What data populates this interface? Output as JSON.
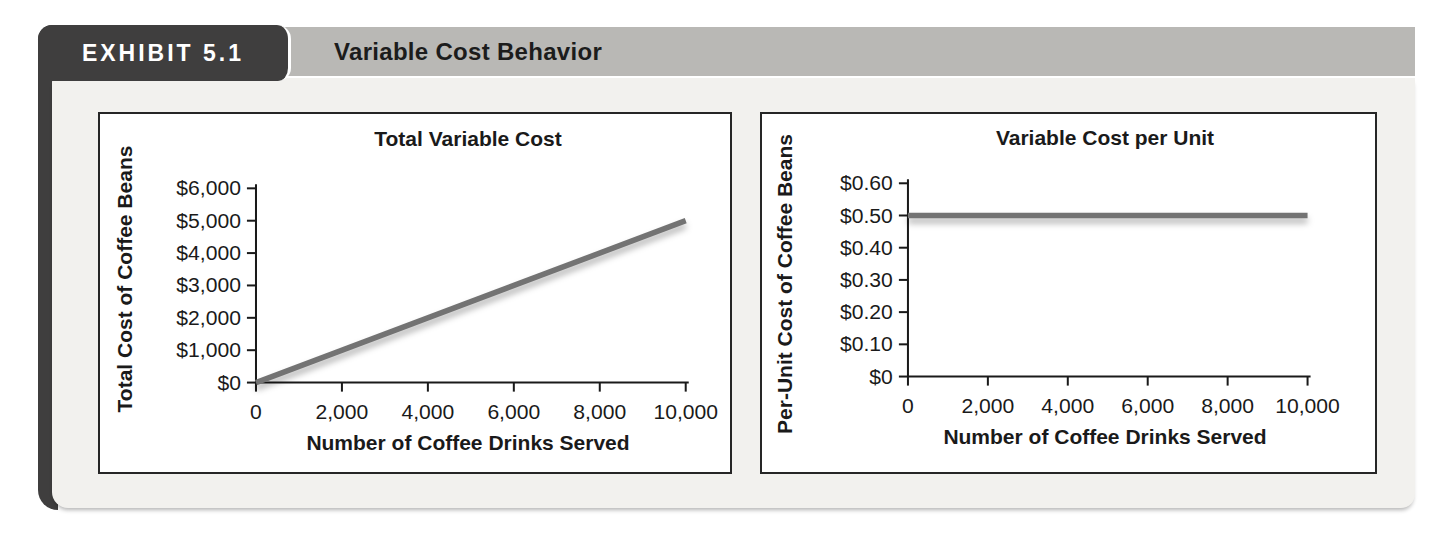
{
  "header": {
    "exhibit_label": "EXHIBIT 5.1",
    "title": "Variable Cost Behavior"
  },
  "colors": {
    "badge_bg": "#3f3e3e",
    "title_bar_bg": "#b9b8b5",
    "panel_bg": "#f2f1ee",
    "chart_border": "#262626",
    "axis": "#1a1a1a",
    "line": "#737373",
    "text": "#1a1a1a"
  },
  "chart_data": [
    {
      "type": "line",
      "title": "Total Variable Cost",
      "xlabel": "Number of Coffee Drinks Served",
      "ylabel": "Total Cost of Coffee Beans",
      "xlim": [
        0,
        10000
      ],
      "ylim": [
        0,
        6000
      ],
      "grid": false,
      "legend": null,
      "xticks": {
        "values": [
          0,
          2000,
          4000,
          6000,
          8000,
          10000
        ],
        "labels": [
          "0",
          "2,000",
          "4,000",
          "6,000",
          "8,000",
          "10,000"
        ]
      },
      "yticks": {
        "values": [
          0,
          1000,
          2000,
          3000,
          4000,
          5000,
          6000
        ],
        "labels": [
          "$0",
          "$1,000",
          "$2,000",
          "$3,000",
          "$4,000",
          "$5,000",
          "$6,000"
        ]
      },
      "series": [
        {
          "name": "Total variable cost of coffee beans",
          "points": [
            [
              0,
              0
            ],
            [
              10000,
              5000
            ]
          ]
        }
      ]
    },
    {
      "type": "line",
      "title": "Variable Cost per Unit",
      "xlabel": "Number of Coffee Drinks Served",
      "ylabel": "Per-Unit Cost of Coffee Beans",
      "xlim": [
        0,
        10000
      ],
      "ylim": [
        0,
        0.6
      ],
      "grid": false,
      "legend": null,
      "xticks": {
        "values": [
          0,
          2000,
          4000,
          6000,
          8000,
          10000
        ],
        "labels": [
          "0",
          "2,000",
          "4,000",
          "6,000",
          "8,000",
          "10,000"
        ]
      },
      "yticks": {
        "values": [
          0,
          0.1,
          0.2,
          0.3,
          0.4,
          0.5,
          0.6
        ],
        "labels": [
          "$0",
          "$0.10",
          "$0.20",
          "$0.30",
          "$0.40",
          "$0.50",
          "$0.60"
        ]
      },
      "series": [
        {
          "name": "Variable cost per unit",
          "points": [
            [
              0,
              0.5
            ],
            [
              10000,
              0.5
            ]
          ]
        }
      ]
    }
  ]
}
